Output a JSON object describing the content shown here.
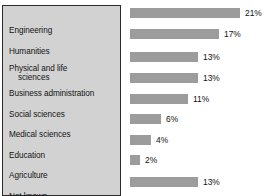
{
  "chart_data": {
    "type": "bar",
    "orientation": "horizontal",
    "title": "",
    "xlabel": "",
    "ylabel": "",
    "grid": false,
    "legend": null,
    "axis_visible": false,
    "value_suffix": "%",
    "xlim": [
      0,
      21
    ],
    "categories": [
      "Engineering",
      "Humanities",
      "Physical and life sciences",
      "Business administration",
      "Social sciences",
      "Medical sciences",
      "Education",
      "Agriculture",
      "Not known"
    ],
    "values": [
      21,
      17,
      13,
      13,
      11,
      6,
      4,
      2,
      13
    ],
    "value_labels": [
      "21%",
      "17%",
      "13%",
      "13%",
      "11%",
      "6%",
      "4%",
      "2%",
      "13%"
    ],
    "colors": {
      "bar": "#9c9c9c",
      "label_panel_background": "#d2d2d2",
      "label_panel_border": "#2b2b2b",
      "text": "#141414",
      "page_background": "#ffffff"
    }
  },
  "labels": [
    {
      "line1": "Engineering",
      "line2": ""
    },
    {
      "line1": "Humanities",
      "line2": ""
    },
    {
      "line1": "Physical and life",
      "line2": "sciences"
    },
    {
      "line1": "Business administration",
      "line2": ""
    },
    {
      "line1": "Social sciences",
      "line2": ""
    },
    {
      "line1": "Medical sciences",
      "line2": ""
    },
    {
      "line1": "Education",
      "line2": ""
    },
    {
      "line1": "Agriculture",
      "line2": ""
    },
    {
      "line1": "Not known",
      "line2": ""
    }
  ]
}
